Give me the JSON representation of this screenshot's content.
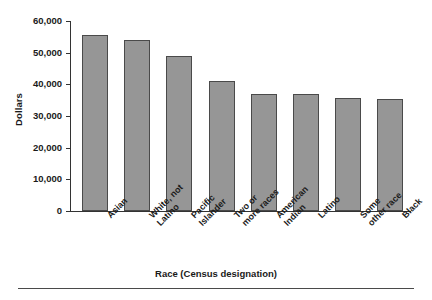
{
  "chart_data": {
    "type": "bar",
    "title": "",
    "xlabel": "Race (Census designation)",
    "ylabel": "Dollars",
    "categories": [
      "Asian",
      "White, not Latino",
      "Pacific Islander",
      "Two or more races",
      "American Indian",
      "Latino",
      "Some other race",
      "Black"
    ],
    "category_lines": [
      [
        "Asian"
      ],
      [
        "White, not",
        "Latino"
      ],
      [
        "Pacific",
        "Islander"
      ],
      [
        "Two or",
        "more races"
      ],
      [
        "American",
        "Indian"
      ],
      [
        "Latino"
      ],
      [
        "Some",
        "other race"
      ],
      [
        "Black"
      ]
    ],
    "values": [
      55700,
      54000,
      48800,
      41000,
      36900,
      36800,
      35700,
      35400
    ],
    "ylim": [
      0,
      60000
    ],
    "ytick_values": [
      0,
      10000,
      20000,
      30000,
      40000,
      50000,
      60000
    ],
    "ytick_labels": [
      "0",
      "10,000",
      "20,000",
      "30,000",
      "40,000",
      "50,000",
      "60,000"
    ],
    "grid": false,
    "legend": null,
    "bar_color": "#969696",
    "bar_edge_color": "#4a4a4a",
    "axis_color": "#333333"
  }
}
